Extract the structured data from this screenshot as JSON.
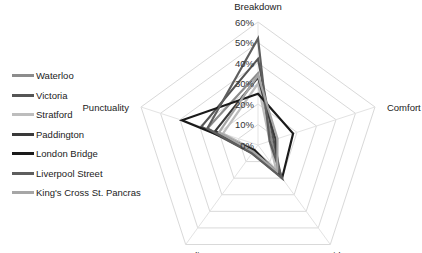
{
  "chart_data": {
    "type": "radar",
    "title": "",
    "axes": [
      "Breakdown",
      "Comfort",
      "Covid-19",
      "Overcrowding",
      "Punctuality"
    ],
    "tick_labels": [
      "0%",
      "10%",
      "20%",
      "30%",
      "40%",
      "50%",
      "60%"
    ],
    "rlim": [
      0,
      60
    ],
    "grid": true,
    "legend_position": "left",
    "series": [
      {
        "name": "Waterloo",
        "color": "#8c8c8c",
        "values": [
          35,
          7,
          18,
          4,
          26
        ]
      },
      {
        "name": "Victoria",
        "color": "#555555",
        "values": [
          42,
          8,
          19,
          5,
          29
        ]
      },
      {
        "name": "Stratford",
        "color": "#bdbdbd",
        "values": [
          30,
          6,
          15,
          3,
          18
        ]
      },
      {
        "name": "Paddington",
        "color": "#3a3a3a",
        "values": [
          33,
          9,
          17,
          4,
          22
        ]
      },
      {
        "name": "London Bridge",
        "color": "#1a1a1a",
        "values": [
          25,
          18,
          20,
          3,
          39
        ]
      },
      {
        "name": "Liverpool Street",
        "color": "#5e5e5e",
        "values": [
          52,
          6,
          20,
          5,
          26
        ]
      },
      {
        "name": "King's Cross St. Pancras",
        "color": "#a6a6a6",
        "values": [
          34,
          10,
          16,
          4,
          20
        ]
      }
    ]
  },
  "legend": {
    "items": [
      {
        "label": "Waterloo",
        "color": "#8c8c8c"
      },
      {
        "label": "Victoria",
        "color": "#555555"
      },
      {
        "label": "Stratford",
        "color": "#bdbdbd"
      },
      {
        "label": "Paddington",
        "color": "#3a3a3a"
      },
      {
        "label": "London Bridge",
        "color": "#1a1a1a"
      },
      {
        "label": "Liverpool Street",
        "color": "#5e5e5e"
      },
      {
        "label": "King's Cross St. Pancras",
        "color": "#a6a6a6"
      }
    ]
  }
}
